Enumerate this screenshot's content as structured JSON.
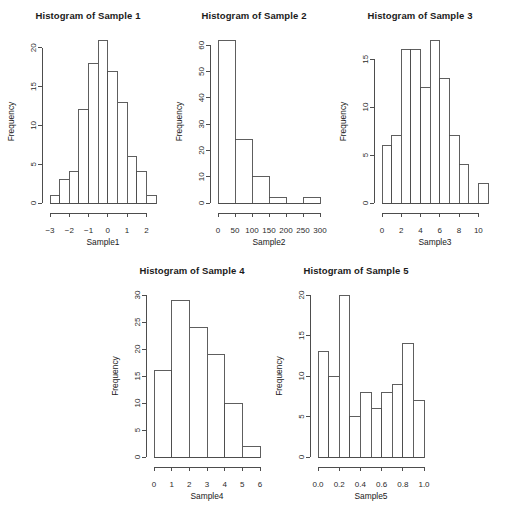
{
  "figure": {
    "background_color": "#ffffff",
    "axis_color": "#4d4d4d",
    "bar_fill": "#ffffff",
    "bar_stroke": "#4d4d4d"
  },
  "charts": [
    {
      "id": "sample1",
      "type": "bar",
      "title": "Histogram of Sample 1",
      "xlabel": "Sample1",
      "ylabel": "Frequency",
      "bin_edges": [
        -3,
        -2.5,
        -2,
        -1.5,
        -1,
        -0.5,
        0,
        0.5,
        1,
        1.5,
        2,
        2.5
      ],
      "values": [
        1,
        3,
        4,
        12,
        18,
        21,
        17,
        13,
        6,
        4,
        1
      ],
      "xticks": [
        -3,
        -2,
        -1,
        0,
        1,
        2
      ],
      "xtick_labels": [
        "−3",
        "−2",
        "−1",
        "0",
        "1",
        "2"
      ],
      "yticks": [
        0,
        5,
        10,
        15,
        20
      ],
      "ytick_labels": [
        "0",
        "5",
        "10",
        "15",
        "20"
      ],
      "xlim": [
        -3,
        2.5
      ],
      "ylim": [
        0,
        21
      ],
      "grid": false
    },
    {
      "id": "sample2",
      "type": "bar",
      "title": "Histogram of Sample 2",
      "xlabel": "Sample2",
      "ylabel": "Frequency",
      "bin_edges": [
        0,
        50,
        100,
        150,
        200,
        250,
        300
      ],
      "values": [
        62,
        24,
        10,
        2,
        0,
        2
      ],
      "xticks": [
        0,
        50,
        100,
        150,
        200,
        250,
        300
      ],
      "xtick_labels": [
        "0",
        "50",
        "100",
        "150",
        "200",
        "250",
        "300"
      ],
      "yticks": [
        0,
        10,
        20,
        30,
        40,
        50,
        60
      ],
      "ytick_labels": [
        "0",
        "10",
        "20",
        "30",
        "40",
        "50",
        "60"
      ],
      "xlim": [
        0,
        300
      ],
      "ylim": [
        0,
        62
      ],
      "grid": false
    },
    {
      "id": "sample3",
      "type": "bar",
      "title": "Histogram of Sample 3",
      "xlabel": "Sample3",
      "ylabel": "Frequency",
      "bin_edges": [
        0,
        1,
        2,
        3,
        4,
        5,
        6,
        7,
        8,
        9,
        10,
        11
      ],
      "values": [
        6,
        7,
        16,
        16,
        12,
        17,
        13,
        7,
        4,
        0,
        2
      ],
      "xticks": [
        0,
        2,
        4,
        6,
        8,
        10
      ],
      "xtick_labels": [
        "0",
        "2",
        "4",
        "6",
        "8",
        "10"
      ],
      "yticks": [
        0,
        5,
        10,
        15
      ],
      "ytick_labels": [
        "0",
        "5",
        "10",
        "15"
      ],
      "xlim": [
        0,
        11
      ],
      "ylim": [
        0,
        17
      ],
      "grid": false
    },
    {
      "id": "sample4",
      "type": "bar",
      "title": "Histogram of Sample 4",
      "xlabel": "Sample4",
      "ylabel": "Frequency",
      "bin_edges": [
        0,
        1,
        2,
        3,
        4,
        5,
        6
      ],
      "values": [
        16,
        29,
        24,
        19,
        10,
        2
      ],
      "xticks": [
        0,
        1,
        2,
        3,
        4,
        5,
        6
      ],
      "xtick_labels": [
        "0",
        "1",
        "2",
        "3",
        "4",
        "5",
        "6"
      ],
      "yticks": [
        0,
        5,
        10,
        15,
        20,
        25,
        30
      ],
      "ytick_labels": [
        "0",
        "5",
        "10",
        "15",
        "20",
        "25",
        "30"
      ],
      "xlim": [
        0,
        6
      ],
      "ylim": [
        0,
        30
      ],
      "grid": false
    },
    {
      "id": "sample5",
      "type": "bar",
      "title": "Histogram of Sample 5",
      "xlabel": "Sample5",
      "ylabel": "Frequency",
      "bin_edges": [
        0.0,
        0.1,
        0.2,
        0.3,
        0.4,
        0.5,
        0.6,
        0.7,
        0.8,
        0.9,
        1.0
      ],
      "values": [
        13,
        10,
        20,
        5,
        8,
        6,
        8,
        9,
        14,
        7
      ],
      "xticks": [
        0.0,
        0.2,
        0.4,
        0.6,
        0.8,
        1.0
      ],
      "xtick_labels": [
        "0.0",
        "0.2",
        "0.4",
        "0.6",
        "0.8",
        "1.0"
      ],
      "yticks": [
        0,
        5,
        10,
        15,
        20
      ],
      "ytick_labels": [
        "0",
        "5",
        "10",
        "15",
        "20"
      ],
      "xlim": [
        0.0,
        1.0
      ],
      "ylim": [
        0,
        20
      ],
      "grid": false
    }
  ],
  "layout": {
    "panels": [
      {
        "chart": 0,
        "left": 4,
        "top": 10,
        "width": 168,
        "height": 245
      },
      {
        "chart": 1,
        "left": 172,
        "top": 10,
        "width": 164,
        "height": 245
      },
      {
        "chart": 2,
        "left": 336,
        "top": 10,
        "width": 168,
        "height": 245
      },
      {
        "chart": 3,
        "left": 108,
        "top": 265,
        "width": 168,
        "height": 244
      },
      {
        "chart": 4,
        "left": 272,
        "top": 265,
        "width": 168,
        "height": 244
      }
    ]
  }
}
